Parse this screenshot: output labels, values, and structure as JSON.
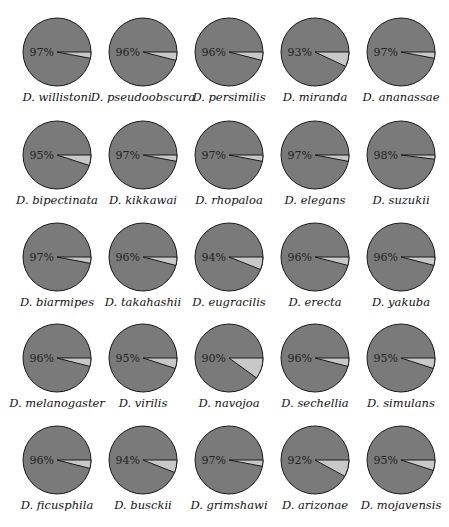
{
  "chart_data": {
    "type": "pie",
    "layout": {
      "rows": 5,
      "cols": 5
    },
    "colors": {
      "major": "#7a7a7a",
      "minor": "#c8c8c8",
      "outline": "#1a1a1a"
    },
    "charts": [
      {
        "species": "D. willistoni",
        "value": 97
      },
      {
        "species": "D. pseudoobscura",
        "value": 96
      },
      {
        "species": "D. persimilis",
        "value": 96
      },
      {
        "species": "D. miranda",
        "value": 93
      },
      {
        "species": "D. ananassae",
        "value": 97
      },
      {
        "species": "D. bipectinata",
        "value": 95
      },
      {
        "species": "D. kikkawai",
        "value": 97
      },
      {
        "species": "D. rhopaloa",
        "value": 97
      },
      {
        "species": "D. elegans",
        "value": 97
      },
      {
        "species": "D. suzukii",
        "value": 98
      },
      {
        "species": "D. biarmipes",
        "value": 97
      },
      {
        "species": "D. takahashii",
        "value": 96
      },
      {
        "species": "D. eugracilis",
        "value": 94
      },
      {
        "species": "D. erecta",
        "value": 96
      },
      {
        "species": "D. yakuba",
        "value": 96
      },
      {
        "species": "D. melanogaster",
        "value": 96
      },
      {
        "species": "D. virilis",
        "value": 95
      },
      {
        "species": "D. navojoa",
        "value": 90
      },
      {
        "species": "D. sechellia",
        "value": 96
      },
      {
        "species": "D. simulans",
        "value": 95
      },
      {
        "species": "D. ficusphila",
        "value": 96
      },
      {
        "species": "D. busckii",
        "value": 94
      },
      {
        "species": "D. grimshawi",
        "value": 97
      },
      {
        "species": "D. arizonae",
        "value": 92
      },
      {
        "species": "D. mojavensis",
        "value": 95
      }
    ]
  }
}
